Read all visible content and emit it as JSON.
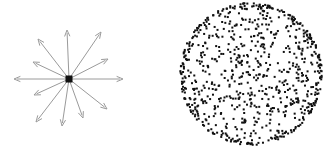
{
  "figure": {
    "title": "",
    "background_color": "#ffffff",
    "width": 335,
    "height": 152,
    "panel_count": 2
  },
  "panels": [
    {
      "id": "radial-arrows",
      "name": "radial-arrow-burst",
      "caption": "",
      "origin": {
        "x": 69,
        "y": 79
      },
      "center_marker": {
        "shape": "square",
        "size": 7,
        "color": "#111111"
      },
      "arrow_color": "#9a9a9a",
      "arrow_stroke_width": 1,
      "arrowhead_length": 6,
      "arrowhead_width": 5,
      "arrow_count": 12,
      "arrows": [
        {
          "index": 1,
          "angle_deg": 0,
          "length": 54,
          "tip": {
            "x": 123,
            "y": 79
          }
        },
        {
          "index": 2,
          "angle_deg": 27,
          "length": 44,
          "tip": {
            "x": 108,
            "y": 59
          }
        },
        {
          "index": 3,
          "angle_deg": 56,
          "length": 57,
          "tip": {
            "x": 101,
            "y": 32
          }
        },
        {
          "index": 4,
          "angle_deg": 92,
          "length": 49,
          "tip": {
            "x": 67,
            "y": 30
          }
        },
        {
          "index": 5,
          "angle_deg": 128,
          "length": 51,
          "tip": {
            "x": 38,
            "y": 39
          }
        },
        {
          "index": 6,
          "angle_deg": 155,
          "length": 40,
          "tip": {
            "x": 33,
            "y": 62
          }
        },
        {
          "index": 7,
          "angle_deg": 180,
          "length": 55,
          "tip": {
            "x": 14,
            "y": 79
          }
        },
        {
          "index": 8,
          "angle_deg": 205,
          "length": 39,
          "tip": {
            "x": 34,
            "y": 95
          }
        },
        {
          "index": 9,
          "angle_deg": 232,
          "length": 54,
          "tip": {
            "x": 36,
            "y": 122
          }
        },
        {
          "index": 10,
          "angle_deg": 262,
          "length": 48,
          "tip": {
            "x": 62,
            "y": 126
          }
        },
        {
          "index": 11,
          "angle_deg": 290,
          "length": 42,
          "tip": {
            "x": 83,
            "y": 118
          }
        },
        {
          "index": 12,
          "angle_deg": 322,
          "length": 48,
          "tip": {
            "x": 107,
            "y": 109
          }
        }
      ]
    },
    {
      "id": "dot-disk",
      "name": "dense-dot-disk",
      "caption": "",
      "center": {
        "x": 84,
        "y": 74
      },
      "radius": 71,
      "dot_color": "#111111",
      "dot_size": 2,
      "dot_shape": "square",
      "interior_dot_count": 560,
      "rim_dot_count": 260,
      "rim_band_fraction": 0.1,
      "total_dot_count": 820,
      "density_note": "uniform interior with denser boundary rim"
    }
  ]
}
